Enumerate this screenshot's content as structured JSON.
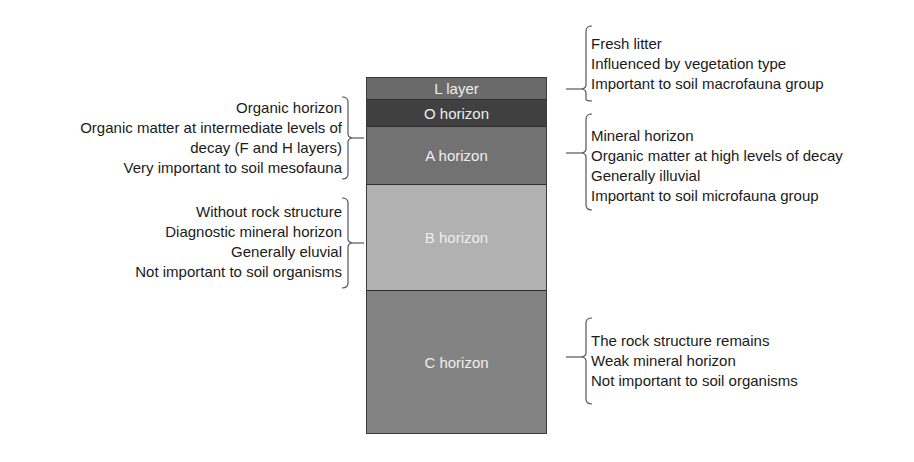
{
  "diagram": {
    "type": "soil-profile",
    "layers": [
      {
        "label": "L layer",
        "color": "#6a6a6a"
      },
      {
        "label": "O horizon",
        "color": "#404040"
      },
      {
        "label": "A horizon",
        "color": "#727272"
      },
      {
        "label": "B horizon",
        "color": "#b1b1b1"
      },
      {
        "label": "C horizon",
        "color": "#838383"
      }
    ],
    "annotations": {
      "o_horizon": {
        "lines": [
          "Organic horizon",
          "Organic matter at intermediate levels of",
          "decay (F and H layers)",
          "Very important to soil mesofauna"
        ]
      },
      "b_horizon": {
        "lines": [
          "Without rock structure",
          "Diagnostic mineral horizon",
          "Generally eluvial",
          "Not important to soil organisms"
        ]
      },
      "l_layer": {
        "lines": [
          "Fresh litter",
          "Influenced by vegetation type",
          "Important to soil macrofauna group"
        ]
      },
      "a_horizon": {
        "lines": [
          "Mineral horizon",
          "Organic matter at high levels of decay",
          "Generally illuvial",
          "Important to soil microfauna group"
        ]
      },
      "c_horizon": {
        "lines": [
          "The rock structure remains",
          "Weak mineral horizon",
          "Not important to soil organisms"
        ]
      }
    }
  }
}
